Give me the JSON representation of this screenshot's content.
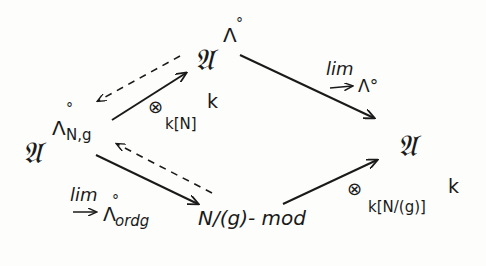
{
  "diagram": {
    "nodes": {
      "left": {
        "base": "𝔄",
        "sup_symbol": "Λ",
        "sup_ring": "°",
        "sup_sub": "N,g"
      },
      "top": {
        "base": "𝔄",
        "sup_symbol": "Λ",
        "sup_ring": "°"
      },
      "right": {
        "base": "𝔄"
      },
      "bottom": {
        "text": "N/(g)- mod"
      }
    },
    "edges": {
      "left_to_top": {
        "style": "solid",
        "label_op": "⊗",
        "label_sub": "k[N]",
        "label_sup": "k"
      },
      "top_to_left": {
        "style": "dashed"
      },
      "top_to_right": {
        "style": "solid",
        "label_lim": "lim",
        "label_arrow": "→",
        "label_index": "Λ°"
      },
      "left_to_bottom": {
        "style": "solid",
        "label_lim": "lim",
        "label_arrow": "→",
        "label_index": "Λ",
        "label_index_ring": "°",
        "label_index_sub": "ordg"
      },
      "bottom_to_left": {
        "style": "dashed"
      },
      "bottom_to_right": {
        "style": "solid",
        "label_op": "⊗",
        "label_sub": "k[N/(g)]",
        "label_sup": "k"
      }
    },
    "colors": {
      "ink": "#1a1a1a",
      "paper": "#fdfdfb"
    }
  }
}
